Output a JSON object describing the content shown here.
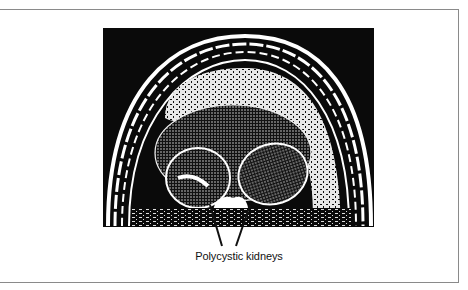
{
  "figure": {
    "caption": "Polycystic kidneys",
    "image_description": "Transverse abdominal ultrasound/CT scan showing enlarged polycystic kidneys",
    "pointer_count": 2
  },
  "colors": {
    "frame_border": "#8a8a8a",
    "scan_background": "#0a0a0a",
    "scan_foreground": "#ffffff",
    "caption_text": "#111111"
  }
}
